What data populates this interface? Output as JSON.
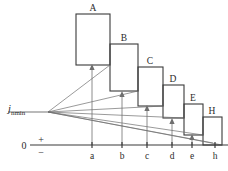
{
  "figure": {
    "axis": {
      "origin_label": "0",
      "plus_sign": "+",
      "minus_sign": "−",
      "level_label_var": "j",
      "level_label_sub": "nmin",
      "tick_labels": [
        "a",
        "b",
        "c",
        "d",
        "e",
        "h"
      ]
    },
    "bars": [
      {
        "label": "A",
        "x": 76,
        "y": 14,
        "w": 34,
        "h": 51
      },
      {
        "label": "B",
        "x": 110,
        "y": 44,
        "w": 28,
        "h": 47
      },
      {
        "label": "C",
        "x": 138,
        "y": 67,
        "w": 25,
        "h": 39
      },
      {
        "label": "D",
        "x": 163,
        "y": 85,
        "w": 21,
        "h": 33
      },
      {
        "label": "E",
        "x": 184,
        "y": 104,
        "w": 19,
        "h": 31
      },
      {
        "label": "H",
        "x": 203,
        "y": 117,
        "w": 19,
        "h": 28
      }
    ],
    "ticks": [
      {
        "label": "a",
        "x": 92
      },
      {
        "label": "b",
        "x": 122
      },
      {
        "label": "c",
        "x": 147
      },
      {
        "label": "d",
        "x": 172
      },
      {
        "label": "e",
        "x": 192
      },
      {
        "label": "h",
        "x": 215
      }
    ],
    "fan_origin": {
      "x": 48,
      "y": 112
    },
    "fan_targets": [
      {
        "x": 92,
        "y": 64
      },
      {
        "x": 122,
        "y": 91
      },
      {
        "x": 147,
        "y": 105
      },
      {
        "x": 172,
        "y": 118
      },
      {
        "x": 192,
        "y": 134
      },
      {
        "x": 215,
        "y": 145
      }
    ],
    "baseline_y": 145,
    "level_y": 112,
    "colors": {
      "stroke": "#3a3a3a",
      "fan": "#6e6e6e",
      "level": "#777777",
      "background": "#ffffff"
    }
  }
}
